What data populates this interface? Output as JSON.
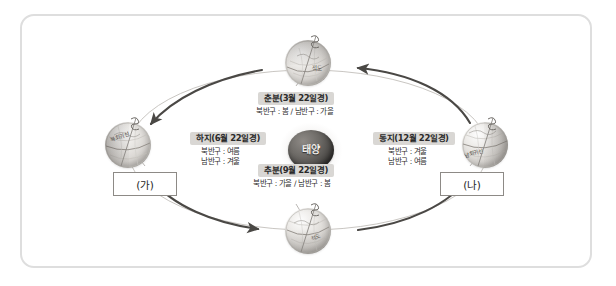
{
  "diagram": {
    "title_visible": false,
    "sun": {
      "label": "태양"
    },
    "seasons": [
      {
        "id": "chunbun",
        "position": "top",
        "chip": "춘분(3월 22일경)",
        "caption_lines": [
          "북반구 : 봄 / 남반구 : 가을"
        ],
        "globe_label": "적도",
        "axis_icon": "tilted-axis-icon"
      },
      {
        "id": "haji",
        "position": "left",
        "chip": "하지(6월 22일경)",
        "caption_lines": [
          "북반구 : 여름",
          "남반구 : 겨울"
        ],
        "globe_label": "북회귀선",
        "axis_icon": "tilted-axis-icon"
      },
      {
        "id": "chubun",
        "position": "bottom",
        "chip": "추분(9월 22일경)",
        "caption_lines": [
          "북반구 : 가을 / 남반구 : 봄"
        ],
        "globe_label": "적도",
        "axis_icon": "tilted-axis-icon"
      },
      {
        "id": "dongji",
        "position": "right",
        "chip": "동지(12월 22일경)",
        "caption_lines": [
          "북반구 : 겨울",
          "남반구 : 여름"
        ],
        "globe_label": "남회귀선",
        "axis_icon": "tilted-axis-icon"
      }
    ],
    "tags": [
      {
        "id": "ga",
        "label": "(가)"
      },
      {
        "id": "na",
        "label": "(나)"
      }
    ],
    "orbit": {
      "direction": "counter-clockwise",
      "arrow_count": 4
    },
    "colors": {
      "frame_border": "#dedede",
      "chip_background": "#d9d7d4",
      "chip_text": "#2a2a2a",
      "caption_text": "#2e2e2e",
      "orbit_line": "#b9b6b2",
      "arrow": "#4a4845",
      "sun_core": "#3e3c3a",
      "tagbox_border": "#8d8a86",
      "page_background": "#ffffff"
    }
  }
}
